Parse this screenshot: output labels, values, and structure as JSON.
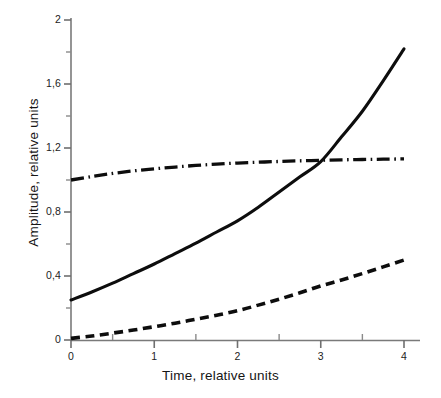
{
  "chart_data": {
    "type": "line",
    "title": "",
    "xlabel": "Time, relative units",
    "ylabel": "Amplitude, relative units",
    "xlim": [
      0,
      4
    ],
    "ylim": [
      0,
      2
    ],
    "grid": false,
    "legend": "none",
    "x_ticks": [
      "0",
      "1",
      "2",
      "3",
      "4"
    ],
    "x_tick_values": [
      0,
      1,
      2,
      3,
      4
    ],
    "x_minor_tick_values": [
      0.5,
      1.5,
      2.5,
      3.5
    ],
    "y_ticks": [
      "0",
      "0,4",
      "0,8",
      "1,2",
      "1,6",
      "2"
    ],
    "y_tick_values": [
      0,
      0.4,
      0.8,
      1.2,
      1.6,
      2
    ],
    "y_minor_tick_values": [
      0.2,
      0.6,
      1.0,
      1.4,
      1.8
    ],
    "decimal_separator": ",",
    "series": [
      {
        "name": "solid-curve",
        "style": "solid",
        "color": "#0d0d0d",
        "x": [
          0,
          0.25,
          0.5,
          0.75,
          1,
          1.25,
          1.5,
          1.75,
          2,
          2.25,
          2.5,
          2.75,
          3,
          3.25,
          3.5,
          3.75,
          4
        ],
        "values": [
          0.25,
          0.3,
          0.355,
          0.415,
          0.475,
          0.54,
          0.605,
          0.675,
          0.745,
          0.83,
          0.925,
          1.02,
          1.115,
          1.27,
          1.43,
          1.62,
          1.82
        ]
      },
      {
        "name": "dash-dot-curve",
        "style": "dash-dot",
        "color": "#0d0d0d",
        "x": [
          0,
          0.25,
          0.5,
          0.75,
          1,
          1.25,
          1.5,
          1.75,
          2,
          2.25,
          2.5,
          2.75,
          3,
          3.25,
          3.5,
          3.75,
          4
        ],
        "values": [
          1.0,
          1.022,
          1.041,
          1.057,
          1.07,
          1.081,
          1.091,
          1.099,
          1.106,
          1.111,
          1.116,
          1.12,
          1.123,
          1.126,
          1.128,
          1.13,
          1.132
        ]
      },
      {
        "name": "dashed-curve",
        "style": "dashed",
        "color": "#0d0d0d",
        "x": [
          0,
          0.25,
          0.5,
          0.75,
          1,
          1.25,
          1.5,
          1.75,
          2,
          2.25,
          2.5,
          2.75,
          3,
          3.25,
          3.5,
          3.75,
          4
        ],
        "values": [
          0.01,
          0.025,
          0.043,
          0.062,
          0.083,
          0.105,
          0.13,
          0.155,
          0.183,
          0.218,
          0.255,
          0.295,
          0.338,
          0.375,
          0.415,
          0.457,
          0.5
        ]
      }
    ],
    "annotations": []
  }
}
